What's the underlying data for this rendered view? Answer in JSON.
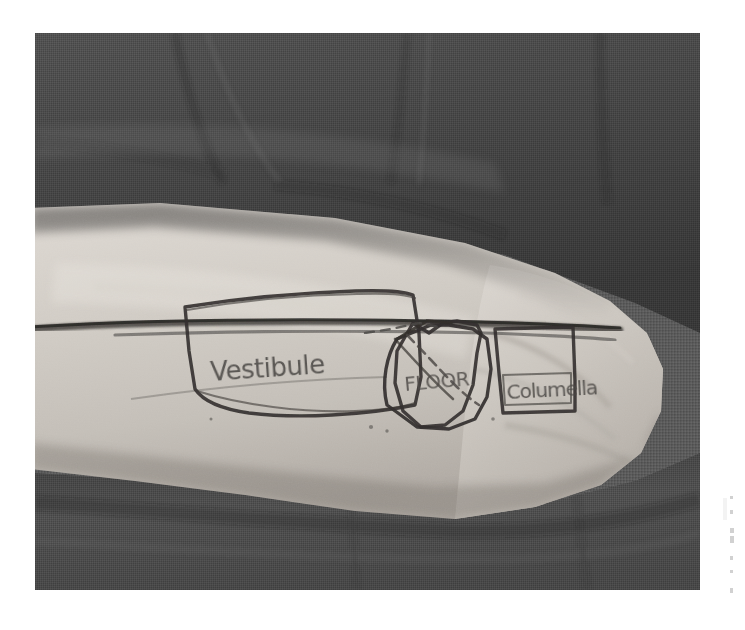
{
  "image": {
    "kind": "photograph",
    "medium": "grayscale photo of ink drawing on human skin",
    "subject": "forearm with surgical planning diagram",
    "background_surface": "dark gray knit fabric",
    "photo_frame": {
      "left": 35,
      "top": 33,
      "width": 665,
      "height": 557
    },
    "page_background_color": "#ffffff"
  },
  "palette": {
    "page_white": "#ffffff",
    "fabric_dark": "#4a4a4a",
    "fabric_mid": "#5e5e5e",
    "fabric_light": "#6f6f6f",
    "fabric_shadow": "#3a3a3a",
    "skin_light": "#d6d2cc",
    "skin_mid": "#c6c1ba",
    "skin_shadow": "#a9a49d",
    "ink_dark": "#2e2c2a",
    "ink_mid": "#55524f",
    "ink_faint": "#8a8682"
  },
  "drawing": {
    "title": "Nasal reconstruction planning sketch",
    "description": "Hand-drawn template outlining three graft subunits along a horizontal reference line drawn on the volar forearm.",
    "reference_line_label": "horizontal reference line",
    "shapes": [
      {
        "id": "vestibule",
        "type": "trapezoid",
        "label": "Vestibule",
        "position": "left"
      },
      {
        "id": "floor",
        "type": "polygon",
        "label": "FLOOR",
        "position": "center"
      },
      {
        "id": "columella",
        "type": "rectangle",
        "label": "Columella",
        "position": "right"
      }
    ],
    "annotations": [
      {
        "id": "dashed-diagonal",
        "type": "dashed-line",
        "label": "dashed incision guide"
      },
      {
        "id": "solid-diagonal",
        "type": "solid-line",
        "label": "diagonal division line"
      }
    ]
  },
  "labels": {
    "vestibule": "Vestibule",
    "floor": "FLOOR",
    "columella": "Columella"
  },
  "margin_marks": {
    "right_edge": {
      "legible": false,
      "description": "faint illegible vertical scan artifact marks"
    }
  }
}
